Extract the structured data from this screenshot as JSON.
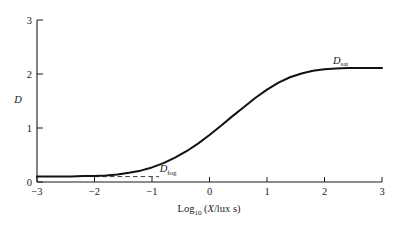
{
  "chart_data": {
    "type": "line",
    "title": "",
    "subtitle": "",
    "xlabel_parts": {
      "main": "Log",
      "sub": "10",
      "rest_open": " (",
      "var": "X",
      "rest_close": "/lux s)"
    },
    "xlabel": "Log10 (X/lux s)",
    "ylabel": "D",
    "xlim": [
      -3,
      3
    ],
    "ylim": [
      0,
      3
    ],
    "grid": false,
    "legend": "none",
    "xticks": [
      -3,
      -2,
      -1,
      0,
      1,
      2,
      3
    ],
    "xtick_labels": [
      "−3",
      "−2",
      "−1",
      "0",
      "1",
      "2",
      "3"
    ],
    "yticks": [
      0,
      1,
      2,
      3
    ],
    "ytick_labels": [
      "0",
      "1",
      "2",
      "3"
    ],
    "series": [
      {
        "name": "characteristic-curve",
        "comment": "D-logH sensitometric curve (sigmoid)",
        "x": [
          -3.0,
          -2.8,
          -2.6,
          -2.4,
          -2.2,
          -2.0,
          -1.8,
          -1.6,
          -1.4,
          -1.2,
          -1.0,
          -0.8,
          -0.6,
          -0.4,
          -0.2,
          0.0,
          0.2,
          0.4,
          0.6,
          0.8,
          1.0,
          1.2,
          1.4,
          1.6,
          1.8,
          2.0,
          2.2,
          2.4,
          2.6,
          2.8,
          3.0
        ],
        "y": [
          0.1,
          0.1,
          0.1,
          0.1,
          0.11,
          0.11,
          0.12,
          0.14,
          0.17,
          0.21,
          0.27,
          0.35,
          0.45,
          0.57,
          0.71,
          0.87,
          1.04,
          1.22,
          1.39,
          1.56,
          1.71,
          1.84,
          1.94,
          2.01,
          2.06,
          2.09,
          2.1,
          2.11,
          2.11,
          2.11,
          2.11
        ]
      }
    ],
    "annotations": [
      {
        "name": "d-sat",
        "label_main": "D",
        "label_sub": "sat",
        "value": 2.11,
        "text_x": 2.28,
        "line_from_x": 2.55,
        "line_to_x": 3.0,
        "style": "dashed"
      },
      {
        "name": "d-fog",
        "label_main": "D",
        "label_sub": "fog",
        "value": 0.1,
        "text_x": -0.72,
        "line_from_x": -2.0,
        "line_to_x": -0.88,
        "style": "dashed"
      }
    ],
    "colors": {
      "curve": "#111111",
      "axis": "#1a1a1a",
      "dashed": "#222222",
      "background": "#ffffff"
    }
  }
}
